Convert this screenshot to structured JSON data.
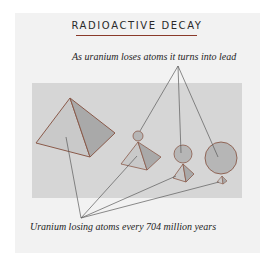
{
  "diagram": {
    "title": "RADIOACTIVE DECAY",
    "top_label": "As uranium loses atoms it turns into lead",
    "bottom_label": "Uranium losing atoms every 704 million years",
    "stages": [
      {
        "name": "stage-1",
        "uranium": "large pyramid",
        "lead": "none"
      },
      {
        "name": "stage-2",
        "uranium": "medium pyramid",
        "lead": "small sphere"
      },
      {
        "name": "stage-3",
        "uranium": "small pyramid",
        "lead": "medium sphere"
      },
      {
        "name": "stage-4",
        "uranium": "tiny pyramid",
        "lead": "large sphere"
      }
    ],
    "colors": {
      "card": "#f2f2f2",
      "panel": "#d6d6d6",
      "pyramid_light": "#c8c8c8",
      "pyramid_dark": "#a8a8a8",
      "sphere": "#b6b6b6",
      "edge": "#8a5a4a",
      "leader": "#5a5a5a"
    }
  }
}
